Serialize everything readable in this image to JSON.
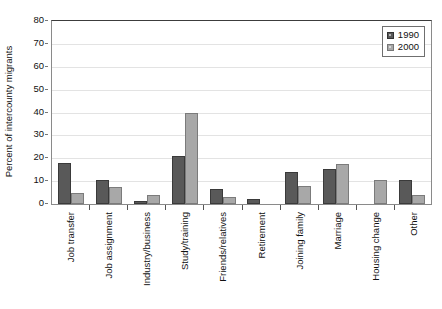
{
  "chart_data": {
    "type": "bar",
    "title": "",
    "xlabel": "",
    "ylabel": "Percent of intercounty migrants",
    "ylim": [
      0,
      80
    ],
    "ytick_step": 10,
    "yticks": [
      "80",
      "70",
      "60",
      "50",
      "40",
      "30",
      "20",
      "10",
      "0"
    ],
    "grid": true,
    "legend_position": "top-right-inside",
    "categories": [
      "Job transfer",
      "Job assignment",
      "Industry/business",
      "Study/training",
      "Friends/relatives",
      "Retirement",
      "Joining family",
      "Marriage",
      "Housing change",
      "Other"
    ],
    "series": [
      {
        "name": "1990",
        "color": "#595959",
        "values": [
          17.8,
          10.3,
          1.5,
          21.2,
          6.5,
          2.0,
          13.8,
          15.5,
          0,
          10.7
        ]
      },
      {
        "name": "2000",
        "color": "#a8a8a8",
        "values": [
          4.6,
          7.5,
          3.8,
          39.6,
          3.0,
          0,
          8.0,
          17.5,
          10.3,
          3.8
        ]
      }
    ]
  },
  "legend": {
    "entries": [
      {
        "label": "1990",
        "swatch": "dark-gray-swatch-icon"
      },
      {
        "label": "2000",
        "swatch": "light-gray-swatch-icon"
      }
    ]
  },
  "header": {
    "clipped_text": ""
  }
}
